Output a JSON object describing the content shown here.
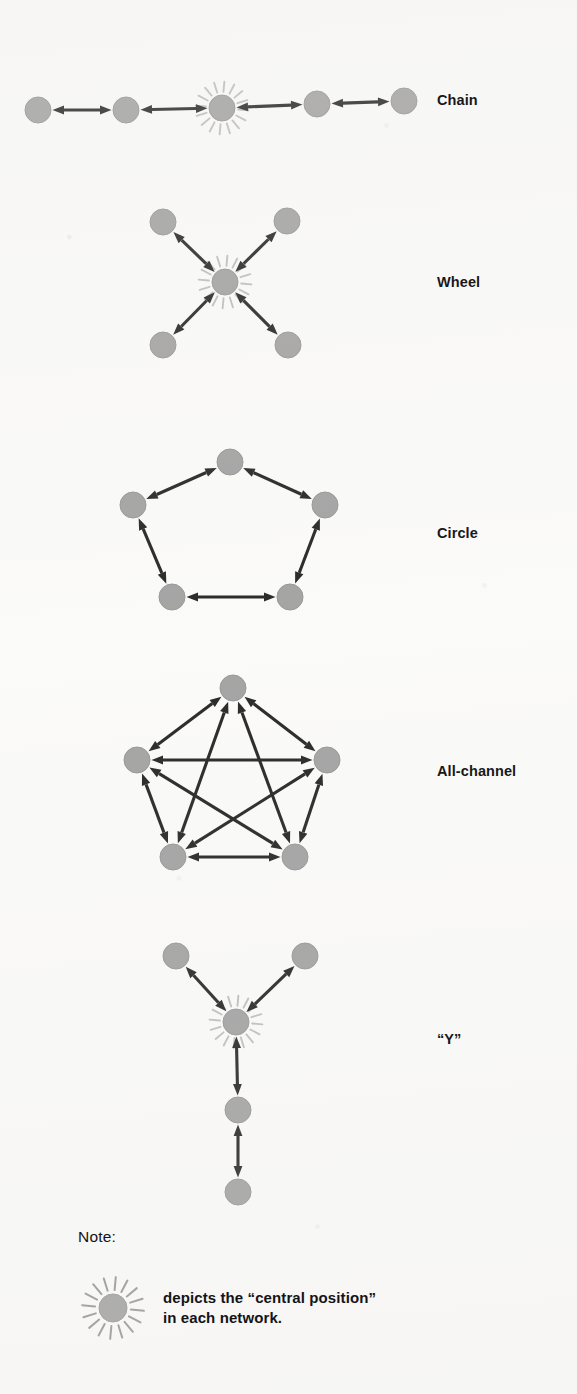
{
  "page": {
    "background_color": "#fbfbfa",
    "node_color": "#9a9a9a",
    "node_stroke_color": "#8c8c8c",
    "edge_color": "#111111",
    "ray_color": "#b9b9b9",
    "text_color": "#141417"
  },
  "networks": [
    {
      "id": "chain",
      "label": "Chain",
      "label_x": 437,
      "label_y": 101,
      "node_radius": 13,
      "nodes": [
        {
          "id": "c1",
          "x": 38,
          "y": 110,
          "central": false
        },
        {
          "id": "c2",
          "x": 126,
          "y": 110,
          "central": false
        },
        {
          "id": "c3",
          "x": 222,
          "y": 108,
          "central": true
        },
        {
          "id": "c4",
          "x": 317,
          "y": 104,
          "central": false
        },
        {
          "id": "c5",
          "x": 404,
          "y": 101,
          "central": false
        }
      ],
      "edges": [
        {
          "from": "c1",
          "to": "c2"
        },
        {
          "from": "c2",
          "to": "c3"
        },
        {
          "from": "c3",
          "to": "c4"
        },
        {
          "from": "c4",
          "to": "c5"
        }
      ]
    },
    {
      "id": "wheel",
      "label": "Wheel",
      "label_x": 437,
      "label_y": 283,
      "node_radius": 13,
      "nodes": [
        {
          "id": "w0",
          "x": 225,
          "y": 282,
          "central": true
        },
        {
          "id": "w1",
          "x": 163,
          "y": 222,
          "central": false
        },
        {
          "id": "w2",
          "x": 287,
          "y": 221,
          "central": false
        },
        {
          "id": "w3",
          "x": 163,
          "y": 345,
          "central": false
        },
        {
          "id": "w4",
          "x": 288,
          "y": 345,
          "central": false
        }
      ],
      "edges": [
        {
          "from": "w0",
          "to": "w1"
        },
        {
          "from": "w0",
          "to": "w2"
        },
        {
          "from": "w0",
          "to": "w3"
        },
        {
          "from": "w0",
          "to": "w4"
        }
      ]
    },
    {
      "id": "circle",
      "label": "Circle",
      "label_x": 437,
      "label_y": 534,
      "node_radius": 13,
      "nodes": [
        {
          "id": "r1",
          "x": 230,
          "y": 462,
          "central": false
        },
        {
          "id": "r2",
          "x": 325,
          "y": 505,
          "central": false
        },
        {
          "id": "r3",
          "x": 290,
          "y": 597,
          "central": false
        },
        {
          "id": "r4",
          "x": 172,
          "y": 597,
          "central": false
        },
        {
          "id": "r5",
          "x": 133,
          "y": 505,
          "central": false
        }
      ],
      "edges": [
        {
          "from": "r1",
          "to": "r2"
        },
        {
          "from": "r2",
          "to": "r3"
        },
        {
          "from": "r3",
          "to": "r4"
        },
        {
          "from": "r4",
          "to": "r5"
        },
        {
          "from": "r5",
          "to": "r1"
        }
      ]
    },
    {
      "id": "all-channel",
      "label": "All-channel",
      "label_x": 437,
      "label_y": 772,
      "node_radius": 13,
      "nodes": [
        {
          "id": "a1",
          "x": 233,
          "y": 688,
          "central": false
        },
        {
          "id": "a2",
          "x": 327,
          "y": 760,
          "central": false
        },
        {
          "id": "a3",
          "x": 295,
          "y": 857,
          "central": false
        },
        {
          "id": "a4",
          "x": 173,
          "y": 857,
          "central": false
        },
        {
          "id": "a5",
          "x": 137,
          "y": 760,
          "central": false
        }
      ],
      "edges": [
        {
          "from": "a1",
          "to": "a2"
        },
        {
          "from": "a1",
          "to": "a3"
        },
        {
          "from": "a1",
          "to": "a4"
        },
        {
          "from": "a1",
          "to": "a5"
        },
        {
          "from": "a2",
          "to": "a3"
        },
        {
          "from": "a2",
          "to": "a4"
        },
        {
          "from": "a2",
          "to": "a5"
        },
        {
          "from": "a3",
          "to": "a4"
        },
        {
          "from": "a3",
          "to": "a5"
        },
        {
          "from": "a4",
          "to": "a5"
        }
      ]
    },
    {
      "id": "y",
      "label": "“Y”",
      "label_x": 437,
      "label_y": 1040,
      "node_radius": 13,
      "nodes": [
        {
          "id": "y1",
          "x": 176,
          "y": 956,
          "central": false
        },
        {
          "id": "y2",
          "x": 305,
          "y": 956,
          "central": false
        },
        {
          "id": "y0",
          "x": 236,
          "y": 1022,
          "central": true
        },
        {
          "id": "y3",
          "x": 238,
          "y": 1110,
          "central": false
        },
        {
          "id": "y4",
          "x": 238,
          "y": 1192,
          "central": false
        }
      ],
      "edges": [
        {
          "from": "y0",
          "to": "y1"
        },
        {
          "from": "y0",
          "to": "y2"
        },
        {
          "from": "y0",
          "to": "y3"
        },
        {
          "from": "y3",
          "to": "y4"
        }
      ]
    }
  ],
  "note": {
    "title": "Note:",
    "legend_node": {
      "x": 113,
      "y": 1308,
      "radius": 14
    },
    "text": "depicts the “central position”\nin each network."
  }
}
